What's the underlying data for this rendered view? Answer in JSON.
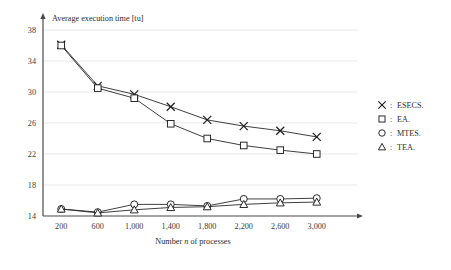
{
  "chart_data": {
    "type": "line",
    "title": "",
    "ylabel": "Average execution time [tu]",
    "xlabel": "Number n of processes",
    "xlabel_parts": {
      "pre": "Number ",
      "italic": "n",
      "post": " of processes"
    },
    "categories": [
      "200",
      "600",
      "1,000",
      "1,400",
      "1,800",
      "2,200",
      "2,600",
      "3,000"
    ],
    "x": [
      200,
      600,
      1000,
      1400,
      1800,
      2200,
      2600,
      3000
    ],
    "xtick_labels": [
      "200",
      "600",
      "1,000",
      "1,400",
      "1,800",
      "2,200",
      "2,600",
      "3,000"
    ],
    "ytick_labels": [
      "38",
      "34",
      "30",
      "26",
      "22",
      "18",
      "14"
    ],
    "yticks": [
      38,
      34,
      30,
      26,
      22,
      18,
      14
    ],
    "ylim": [
      14,
      38
    ],
    "xlim": [
      0,
      3200
    ],
    "grid": true,
    "legend_position": "right",
    "series": [
      {
        "name": "ESECS.",
        "marker": "x",
        "values": [
          36.1,
          30.8,
          29.7,
          28.1,
          26.4,
          25.6,
          25.0,
          24.2
        ]
      },
      {
        "name": "EA.",
        "marker": "square",
        "values": [
          36.0,
          30.5,
          29.2,
          25.9,
          24.0,
          23.1,
          22.5,
          22.0
        ]
      },
      {
        "name": "MTES.",
        "marker": "circle",
        "values": [
          14.9,
          14.5,
          15.5,
          15.5,
          15.3,
          16.2,
          16.2,
          16.3
        ]
      },
      {
        "name": "TEA.",
        "marker": "triangle",
        "values": [
          14.9,
          14.4,
          14.8,
          15.1,
          15.2,
          15.5,
          15.7,
          15.8
        ]
      }
    ]
  },
  "legend": {
    "separator": ":",
    "entries": [
      {
        "label": "ESECS.",
        "marker": "x-marker-icon"
      },
      {
        "label": "EA.",
        "marker": "square-marker-icon"
      },
      {
        "label": "MTES.",
        "marker": "circle-marker-icon"
      },
      {
        "label": "TEA.",
        "marker": "triangle-marker-icon"
      }
    ]
  }
}
